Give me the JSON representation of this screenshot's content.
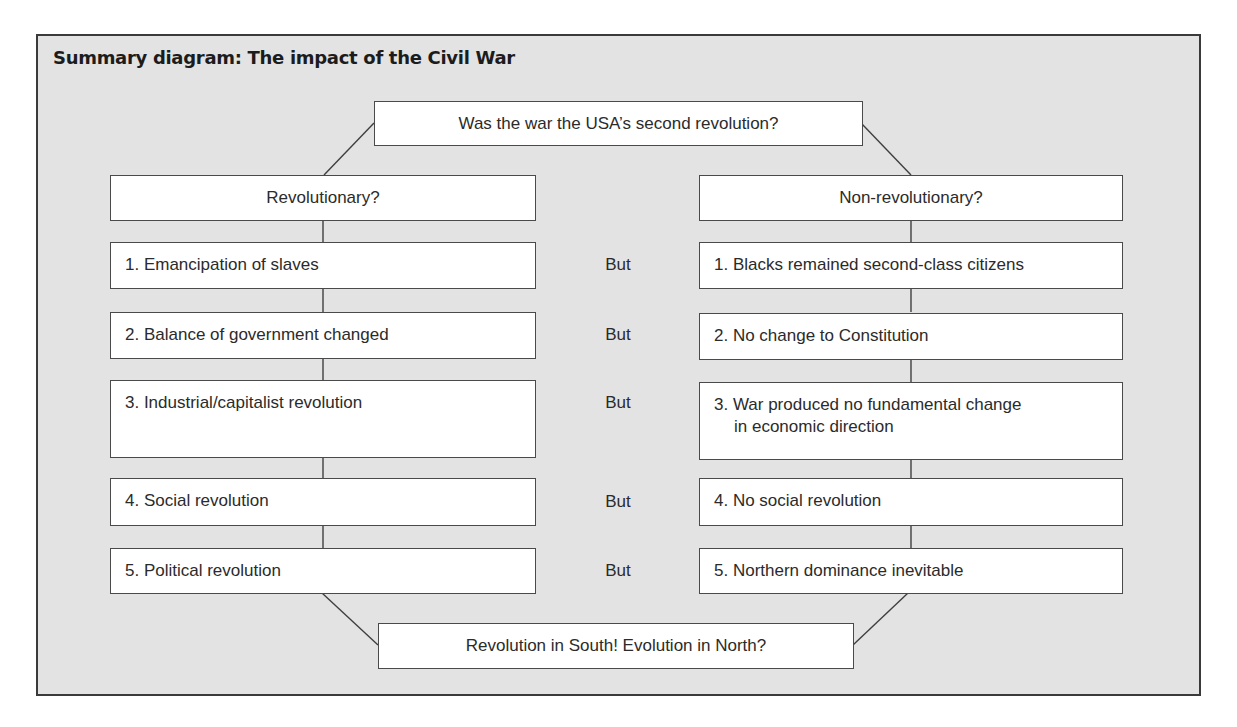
{
  "diagram": {
    "title": "Summary diagram: The impact of the Civil War",
    "top_question": "Was the war the USA’s second revolution?",
    "bottom_conclusion": "Revolution in South! Evolution in North?",
    "connector_word": "But",
    "left_column": {
      "heading": "Revolutionary?",
      "items": [
        {
          "lines": [
            "1. Emancipation of slaves"
          ]
        },
        {
          "lines": [
            "2. Balance of government changed"
          ]
        },
        {
          "lines": [
            "3. Industrial/capitalist revolution"
          ]
        },
        {
          "lines": [
            "4. Social revolution"
          ]
        },
        {
          "lines": [
            "5. Political revolution"
          ]
        }
      ]
    },
    "right_column": {
      "heading": "Non-revolutionary?",
      "items": [
        {
          "lines": [
            "1. Blacks remained second-class citizens"
          ]
        },
        {
          "lines": [
            "2. No change to Constitution"
          ]
        },
        {
          "lines": [
            "3. War produced no fundamental change",
            "in economic direction"
          ]
        },
        {
          "lines": [
            "4. No social revolution"
          ]
        },
        {
          "lines": [
            "5. Northern dominance inevitable"
          ]
        }
      ]
    }
  },
  "colors": {
    "panel_background": "#e3e3e3",
    "panel_border": "#3a3a3a",
    "box_background": "#ffffff",
    "box_border": "#4a4a4a",
    "text": "#2b2b2b"
  }
}
